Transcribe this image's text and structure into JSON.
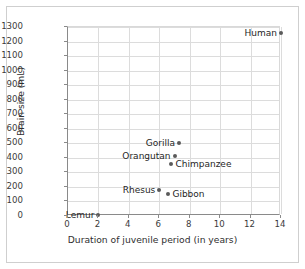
{
  "chart_data": {
    "type": "scatter",
    "title": "",
    "xlabel": "Duration of juvenile period (in years)",
    "ylabel": "Brain size (mL)",
    "xlim": [
      0,
      14
    ],
    "ylim": [
      0,
      1300
    ],
    "xticks": [
      0,
      2,
      4,
      6,
      8,
      10,
      12,
      14
    ],
    "yticks": [
      0,
      100,
      200,
      300,
      400,
      500,
      600,
      700,
      800,
      900,
      1000,
      1100,
      1200,
      1300
    ],
    "grid": true,
    "legend": "none",
    "points": [
      {
        "label": "Lemur",
        "x": 2.0,
        "y": 10,
        "label_side": "left"
      },
      {
        "label": "Rhesus",
        "x": 6.0,
        "y": 180,
        "label_side": "left"
      },
      {
        "label": "Gibbon",
        "x": 6.6,
        "y": 150,
        "label_side": "right"
      },
      {
        "label": "Chimpanzee",
        "x": 6.8,
        "y": 360,
        "label_side": "right"
      },
      {
        "label": "Orangutan",
        "x": 7.0,
        "y": 410,
        "label_side": "left"
      },
      {
        "label": "Gorilla",
        "x": 7.3,
        "y": 505,
        "label_side": "left"
      },
      {
        "label": "Human",
        "x": 14.0,
        "y": 1260,
        "label_side": "left"
      }
    ],
    "colors": {
      "marker": "#5a5a5a",
      "grid": "#dcdcdc",
      "axis": "#8a8a8a",
      "text": "#1f1f1f",
      "frame": "#cfcfcf",
      "background": "#ffffff"
    }
  }
}
